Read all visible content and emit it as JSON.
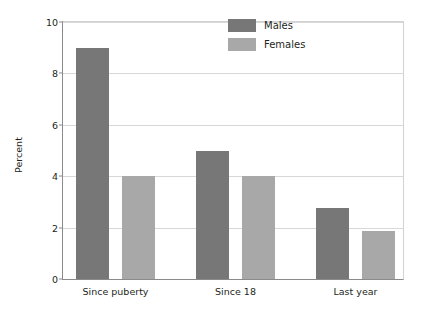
{
  "chart_data": {
    "type": "bar",
    "title": "",
    "subtitle": "",
    "xlabel": "",
    "ylabel": "Percent",
    "categories": [
      "Since puberty",
      "Since 18",
      "Last year"
    ],
    "series": [
      {
        "name": "Males",
        "color": "#777777",
        "values": [
          9.0,
          5.0,
          2.75
        ]
      },
      {
        "name": "Females",
        "color": "#a8a8a8",
        "values": [
          4.0,
          4.0,
          1.85
        ]
      }
    ],
    "ylim": [
      0,
      10
    ],
    "ytick_values": [
      0,
      2,
      4,
      6,
      8,
      10
    ],
    "ytick_labels": [
      "0",
      "2",
      "4",
      "6",
      "8",
      "10"
    ],
    "grid": "horizontal",
    "legend_position": "top-right",
    "annotations": []
  },
  "legend": {
    "entries": [
      {
        "label": "Males",
        "swatch": "males-swatch"
      },
      {
        "label": "Females",
        "swatch": "females-swatch"
      }
    ]
  },
  "axes": {
    "y_axis_title": "Percent"
  },
  "colors": {
    "males": "#777777",
    "females": "#a8a8a8",
    "grid": "#d8d8d8",
    "axis": "#8a8a8a",
    "text": "#231f20",
    "background": "#ffffff"
  }
}
